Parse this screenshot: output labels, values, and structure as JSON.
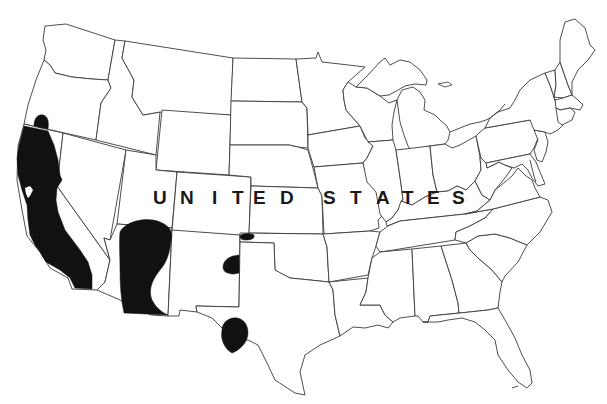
{
  "map": {
    "type": "range map",
    "region": "Contiguous United States",
    "country_label": "UNITED STATES",
    "label_letters": [
      "U",
      "N",
      "I",
      "T",
      "E",
      "D",
      "S",
      "T",
      "A",
      "T",
      "E",
      "S"
    ],
    "colors": {
      "background": "#ffffff",
      "state_borders": "#3a3a3a",
      "range_fill": "#111111",
      "label": "#1a1a1a"
    },
    "range_areas": [
      {
        "name": "Southern Oregon patch",
        "location": "SW Oregon near CA border"
      },
      {
        "name": "California coast and Sierra band",
        "location": "Coastal and central California"
      },
      {
        "name": "Arizona block",
        "location": "Western/central Arizona into SW Utah"
      },
      {
        "name": "Oklahoma panhandle patch",
        "location": "CO/NM/OK border area"
      },
      {
        "name": "Eastern New Mexico patch",
        "location": "East-central New Mexico"
      },
      {
        "name": "Trans-Pecos Texas patch",
        "location": "West Texas Big Bend area"
      }
    ]
  }
}
